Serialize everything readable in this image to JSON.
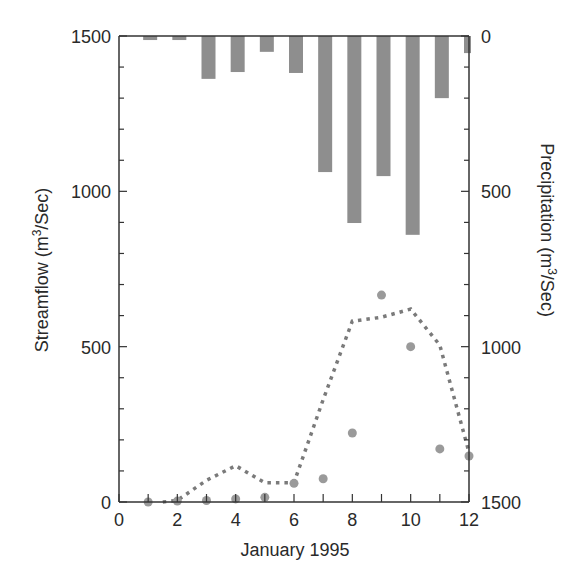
{
  "chart_data": {
    "type": "bar+line+scatter",
    "title": "",
    "xlabel": "January 1995",
    "ylabel": "Streamflow (m³/Sec)",
    "ylabel_right": "Precipitation (m³/Sec)",
    "xlim": [
      0,
      12
    ],
    "ylim": [
      0,
      1500
    ],
    "ylim_right": [
      1500,
      0
    ],
    "right_axis_inverted": true,
    "x_ticks": [
      0,
      2,
      4,
      6,
      8,
      10,
      12
    ],
    "x_minor_ticks": [
      1,
      3,
      5,
      7,
      9,
      11
    ],
    "y_ticks": [
      0,
      500,
      1000,
      1500
    ],
    "y_right_ticks": [
      0,
      500,
      1000,
      1500
    ],
    "y_minor_step": 100,
    "grid": false,
    "legend": null,
    "series": [
      {
        "name": "Precipitation",
        "type": "bar",
        "axis": "right",
        "color": "#8e8e8e",
        "x": [
          1,
          2,
          3,
          4,
          5,
          6,
          7,
          8,
          9,
          10,
          11,
          12
        ],
        "values": [
          13,
          13,
          138,
          116,
          51,
          119,
          438,
          602,
          451,
          640,
          200,
          55
        ]
      },
      {
        "name": "Simulated streamflow",
        "type": "line",
        "style": "dotted",
        "axis": "left",
        "color": "#7a7a7a",
        "x": [
          1.5,
          2,
          3,
          4,
          5,
          6,
          7,
          8,
          9,
          10,
          11,
          12
        ],
        "values": [
          0,
          5,
          70,
          117,
          62,
          62,
          330,
          582,
          595,
          621,
          505,
          160
        ]
      },
      {
        "name": "Observed streamflow",
        "type": "scatter",
        "axis": "left",
        "color": "#9a9a9a",
        "x": [
          1,
          2,
          3,
          4,
          5,
          6,
          7,
          8,
          9,
          10,
          11,
          12
        ],
        "values": [
          0,
          3,
          5,
          10,
          15,
          60,
          75,
          222,
          666,
          500,
          171,
          148
        ]
      }
    ]
  },
  "axes": {
    "left_tick_labels": [
      "0",
      "500",
      "1000",
      "1500"
    ],
    "right_tick_labels": [
      "1500",
      "1000",
      "500",
      "0"
    ],
    "x_tick_labels": [
      "0",
      "2",
      "4",
      "6",
      "8",
      "10",
      "12"
    ],
    "left_title": "Streamflow (m³/Sec)",
    "right_title": "Precipitation (m³/Sec)",
    "x_title": "January 1995"
  }
}
